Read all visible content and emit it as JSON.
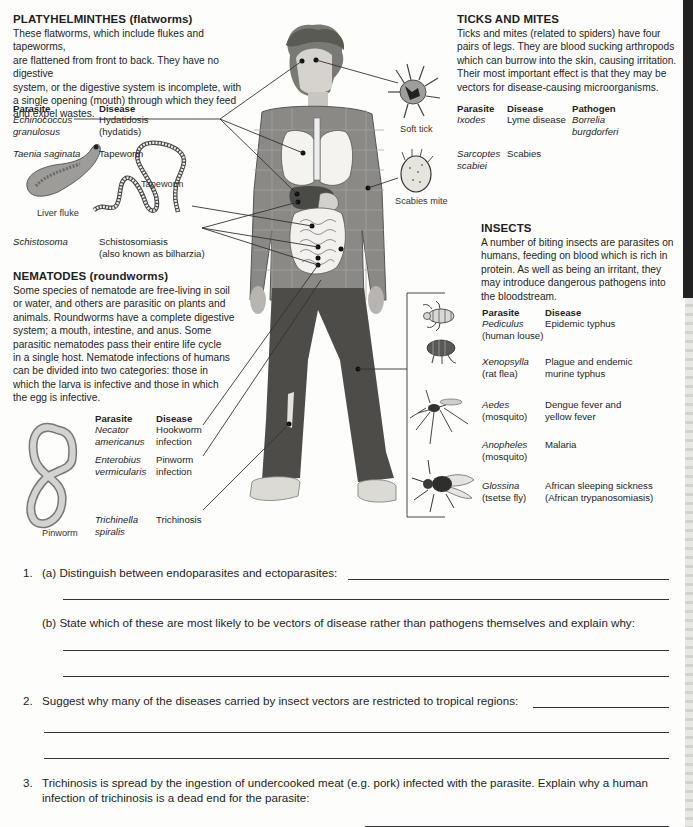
{
  "platyhelminthes": {
    "heading": "PLATYHELMINTHES (flatworms)",
    "lines": [
      "These flatworms, which include flukes and tapeworms,",
      "are flattened from front to back. They have no digestive",
      "system, or the digestive system is incomplete, with",
      "a single opening (mouth) through which they feed",
      "and expel wastes."
    ],
    "col_parasite": "Parasite",
    "col_disease": "Disease",
    "rows": [
      {
        "parasite": [
          "Echinococcus",
          "granulosus"
        ],
        "disease": [
          "Hydatidosis",
          "(hydatids)"
        ]
      },
      {
        "parasite": [
          "Taenia saginata"
        ],
        "disease": [
          "Tapeworm"
        ]
      },
      {
        "parasite": [
          "Schistosoma"
        ],
        "disease": [
          "Schistosomiasis",
          "(also known as bilharzia)"
        ]
      }
    ],
    "captions": {
      "liver_fluke": "Liver fluke",
      "tapeworm": "Tapeworm"
    }
  },
  "nematodes": {
    "heading": "NEMATODES (roundworms)",
    "lines": [
      "Some species of nematode are free-living in soil",
      "or water, and others are parasitic on plants and",
      "animals. Roundworms have a complete digestive",
      "system; a mouth, intestine, and anus. Some",
      "parasitic nematodes pass their entire life cycle",
      "in a single host. Nematode infections of humans",
      "can be divided into two categories: those in",
      "which the larva is infective and those in which",
      "the egg is infective."
    ],
    "col_parasite": "Parasite",
    "col_disease": "Disease",
    "rows": [
      {
        "parasite": [
          "Necator",
          "americanus"
        ],
        "disease": [
          "Hookworm",
          "infection"
        ]
      },
      {
        "parasite": [
          "Enterobius",
          "vermicularis"
        ],
        "disease": [
          "Pinworm",
          "infection"
        ]
      },
      {
        "parasite": [
          "Trichinella",
          "spiralis"
        ],
        "disease": [
          "Trichinosis"
        ]
      }
    ],
    "captions": {
      "pinworm": "Pinworm"
    }
  },
  "ticks_mites": {
    "heading": "TICKS AND MITES",
    "lines": [
      "Ticks and mites (related to spiders) have four",
      "pairs of legs. They are blood sucking arthropods",
      "which can burrow into the skin, causing irritation.",
      "Their most important effect is that they may be",
      "vectors for disease-causing microorganisms."
    ],
    "col_parasite": "Parasite",
    "col_disease": "Disease",
    "col_pathogen": "Pathogen",
    "rows": [
      {
        "parasite": [
          "Ixodes"
        ],
        "disease": [
          "Lyme disease"
        ],
        "pathogen": [
          "Borrelia",
          "burgdorferi"
        ]
      },
      {
        "parasite": [
          "Sarcoptes",
          "scabiei"
        ],
        "disease": [
          "Scabies"
        ],
        "pathogen": []
      }
    ],
    "captions": {
      "soft_tick": "Soft tick",
      "scabies_mite": "Scabies mite"
    }
  },
  "insects": {
    "heading": "INSECTS",
    "lines": [
      "A number of biting insects are parasites on",
      "humans, feeding on blood which is rich in",
      "protein. As well as being an irritant, they",
      "may introduce dangerous pathogens into",
      "the bloodstream."
    ],
    "col_parasite": "Parasite",
    "col_disease": "Disease",
    "rows": [
      {
        "parasite": "Pediculus",
        "common": "(human louse)",
        "disease": [
          "Epidemic typhus"
        ]
      },
      {
        "parasite": "Xenopsylla",
        "common": "(rat flea)",
        "disease": [
          "Plague and endemic",
          "murine typhus"
        ]
      },
      {
        "parasite": "Aedes",
        "common": "(mosquito)",
        "disease": [
          "Dengue fever and",
          "yellow fever"
        ]
      },
      {
        "parasite": "Anopheles",
        "common": "(mosquito)",
        "disease": [
          "Malaria"
        ]
      },
      {
        "parasite": "Glossina",
        "common": "(tsetse fly)",
        "disease": [
          "African sleeping sickness",
          "(African trypanosomiasis)"
        ]
      }
    ]
  },
  "questions": {
    "q1_num": "1.",
    "q1a": "(a) Distinguish between endoparasites and ectoparasites:",
    "q1b": "(b) State which of these are most likely to be vectors of disease rather than pathogens themselves and explain why:",
    "q2_num": "2.",
    "q2": "Suggest why many of the diseases carried by insect vectors are restricted to tropical regions:",
    "q3_num": "3.",
    "q3_line1": "Trichinosis is spread by the ingestion of undercooked meat (e.g. pork) infected with the parasite. Explain why a human",
    "q3_line2": "infection of trichinosis is a dead end for the parasite:"
  }
}
